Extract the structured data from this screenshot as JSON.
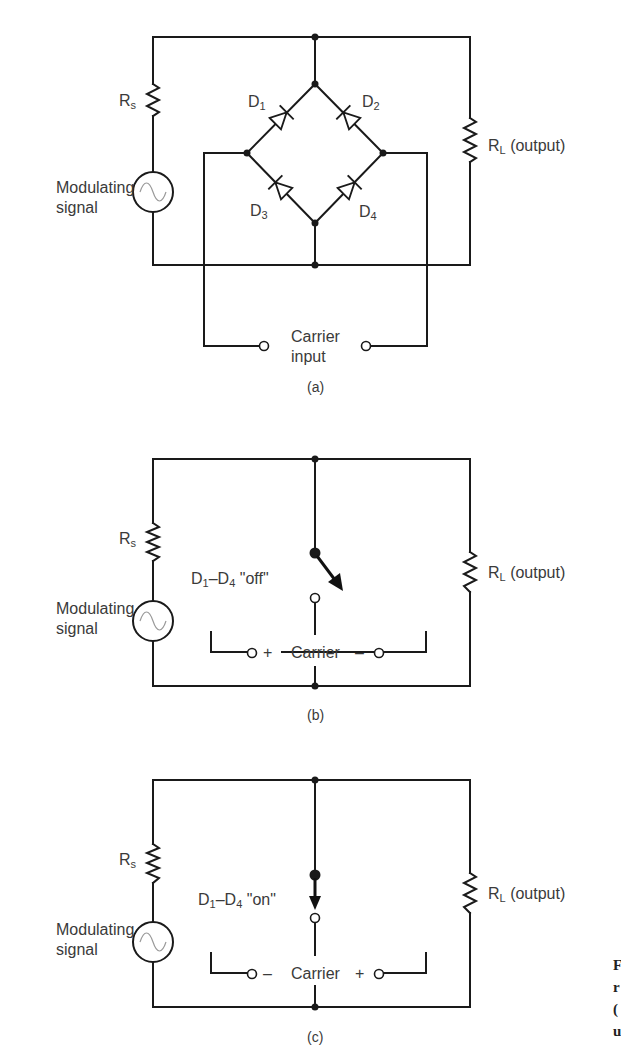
{
  "figure": {
    "panels": [
      {
        "id": "a",
        "caption": "(a)",
        "source_label": "Modulating",
        "source_label2": "signal",
        "rs_label": "R",
        "rs_sub": "s",
        "rl_label": "R",
        "rl_sub": "L",
        "rl_suffix": " (output)",
        "diodes": [
          {
            "name": "D",
            "sub": "1"
          },
          {
            "name": "D",
            "sub": "2"
          },
          {
            "name": "D",
            "sub": "3"
          },
          {
            "name": "D",
            "sub": "4"
          }
        ],
        "carrier_label": "Carrier",
        "carrier_label2": "input"
      },
      {
        "id": "b",
        "caption": "(b)",
        "source_label": "Modulating",
        "source_label2": "signal",
        "rs_label": "R",
        "rs_sub": "s",
        "rl_label": "R",
        "rl_sub": "L",
        "rl_suffix": " (output)",
        "state_label_pre": "D",
        "state_sub1": "1",
        "state_mid": "–D",
        "state_sub2": "4",
        "state_text": " \"off\"",
        "switch_state": "open",
        "carrier_left_sign": "+",
        "carrier_label": "Carrier",
        "carrier_right_sign": "–"
      },
      {
        "id": "c",
        "caption": "(c)",
        "source_label": "Modulating",
        "source_label2": "signal",
        "rs_label": "R",
        "rs_sub": "s",
        "rl_label": "R",
        "rl_sub": "L",
        "rl_suffix": " (output)",
        "state_label_pre": "D",
        "state_sub1": "1",
        "state_mid": "–D",
        "state_sub2": "4",
        "state_text": " \"on\"",
        "switch_state": "closed",
        "carrier_left_sign": "–",
        "carrier_label": "Carrier",
        "carrier_right_sign": "+"
      }
    ],
    "margin_fragments": [
      "F",
      "r",
      "(",
      "u"
    ]
  }
}
